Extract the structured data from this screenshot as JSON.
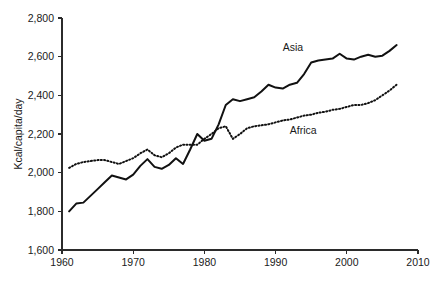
{
  "chart_data": {
    "type": "line",
    "title": "",
    "subtitle": "",
    "xlabel": "",
    "ylabel": "Kcal/capita/day",
    "xlim": [
      1960,
      2010
    ],
    "ylim": [
      1600,
      2800
    ],
    "grid": false,
    "legend_position": "inline-annotation",
    "xticks": [
      1960,
      1970,
      1980,
      1990,
      2000,
      2010
    ],
    "xticklabels": [
      "1960",
      "1970",
      "1980",
      "1990",
      "2000",
      "2010"
    ],
    "yticks": [
      1600,
      1800,
      2000,
      2200,
      2400,
      2600,
      2800
    ],
    "yticklabels": [
      "1,600",
      "1,800",
      "2,000",
      "2,200",
      "2,400",
      "2,600",
      "2,800"
    ],
    "x": [
      1961,
      1962,
      1963,
      1964,
      1965,
      1966,
      1967,
      1968,
      1969,
      1970,
      1971,
      1972,
      1973,
      1974,
      1975,
      1976,
      1977,
      1978,
      1979,
      1980,
      1981,
      1982,
      1983,
      1984,
      1985,
      1986,
      1987,
      1988,
      1989,
      1990,
      1991,
      1992,
      1993,
      1994,
      1995,
      1996,
      1997,
      1998,
      1999,
      2000,
      2001,
      2002,
      2003,
      2004,
      2005,
      2006,
      2007
    ],
    "series": [
      {
        "name": "Asia",
        "style": "solid",
        "label_annotation": "Asia",
        "values": [
          1800,
          1840,
          1845,
          1880,
          1915,
          1950,
          1985,
          1975,
          1965,
          1990,
          2035,
          2070,
          2030,
          2020,
          2040,
          2075,
          2045,
          2120,
          2200,
          2165,
          2175,
          2250,
          2350,
          2380,
          2370,
          2380,
          2390,
          2420,
          2455,
          2440,
          2435,
          2455,
          2465,
          2510,
          2570,
          2580,
          2585,
          2590,
          2615,
          2590,
          2585,
          2600,
          2610,
          2600,
          2605,
          2630,
          2660
        ]
      },
      {
        "name": "Africa",
        "style": "dotted",
        "label_annotation": "Africa",
        "values": [
          2025,
          2045,
          2055,
          2060,
          2065,
          2065,
          2055,
          2045,
          2060,
          2075,
          2100,
          2120,
          2090,
          2080,
          2100,
          2130,
          2145,
          2145,
          2145,
          2175,
          2200,
          2230,
          2240,
          2175,
          2200,
          2230,
          2240,
          2245,
          2250,
          2260,
          2270,
          2275,
          2285,
          2295,
          2300,
          2310,
          2315,
          2325,
          2330,
          2340,
          2350,
          2350,
          2360,
          2375,
          2400,
          2425,
          2455
        ]
      }
    ],
    "annotations": [
      {
        "text": "Asia",
        "x": 1991,
        "y": 2630
      },
      {
        "text": "Africa",
        "x": 1992,
        "y": 2200
      }
    ]
  },
  "axes": {
    "y_axis_title": "Kcal/capita/day"
  }
}
